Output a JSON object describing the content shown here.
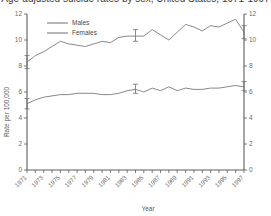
{
  "chart_title": "Age-adjusted suicide rates by sex, United States, 1971-1997",
  "axes": {
    "xlabel": "Year",
    "ylabel": "Rate per 100,000",
    "ylim": [
      0,
      12
    ],
    "yticks": [
      0,
      2,
      4,
      6,
      8,
      10,
      12
    ],
    "ytick_labels": [
      "0",
      "2",
      "4",
      "6",
      "8",
      "10",
      "12"
    ],
    "right_axis_labels": [
      "0",
      "2",
      "4",
      "6",
      "8",
      "10",
      "12"
    ],
    "xlim": [
      1971,
      1997
    ],
    "xtick_labels": [
      "1971",
      "1973",
      "1975",
      "1977",
      "1979",
      "1981",
      "1983",
      "1985",
      "1987",
      "1989",
      "1991",
      "1993",
      "1995",
      "1997"
    ],
    "xtick_rotation": -45,
    "grid": false
  },
  "legend": {
    "position": "top-left-inside",
    "entries": [
      {
        "label": "Males",
        "color": "#7b7b7b"
      },
      {
        "label": "Females",
        "color": "#7b7b7b"
      }
    ]
  },
  "colors": {
    "line": "#7b7b7b",
    "axis": "#5c5c5c",
    "tick_text": "#6b6b6b",
    "title_text": "#3a3a3a",
    "background": "#ffffff"
  },
  "chart_data": {
    "type": "line",
    "title": "Age-adjusted suicide rates by sex, United States, 1971-1997",
    "xlabel": "Year",
    "ylabel": "Rate per 100,000",
    "ylim": [
      0,
      12
    ],
    "xlim": [
      1971,
      1997
    ],
    "grid": false,
    "x": [
      1971,
      1972,
      1973,
      1974,
      1975,
      1976,
      1977,
      1978,
      1979,
      1980,
      1981,
      1982,
      1983,
      1984,
      1985,
      1986,
      1987,
      1988,
      1989,
      1990,
      1991,
      1992,
      1993,
      1994,
      1995,
      1996,
      1997
    ],
    "series": [
      {
        "name": "Males",
        "color": "#7b7b7b",
        "values": [
          8.3,
          8.8,
          9.1,
          9.5,
          9.9,
          9.7,
          9.6,
          9.5,
          9.7,
          9.9,
          9.8,
          10.2,
          10.3,
          10.3,
          10.3,
          10.8,
          10.4,
          10.0,
          10.6,
          11.2,
          11.0,
          10.7,
          11.1,
          11.0,
          11.3,
          11.6,
          10.6
        ],
        "error_bars": [
          {
            "x": 1971,
            "y": 8.3,
            "low": 7.8,
            "high": 8.8
          },
          {
            "x": 1984,
            "y": 10.3,
            "low": 9.9,
            "high": 10.8
          },
          {
            "x": 1997,
            "y": 10.6,
            "low": 10.1,
            "high": 11.1
          }
        ]
      },
      {
        "name": "Females",
        "color": "#7b7b7b",
        "values": [
          5.1,
          5.4,
          5.6,
          5.7,
          5.8,
          5.8,
          5.9,
          5.9,
          5.9,
          5.8,
          5.8,
          5.9,
          6.1,
          6.2,
          6.0,
          6.3,
          6.1,
          6.4,
          6.1,
          6.3,
          6.2,
          6.2,
          6.3,
          6.3,
          6.4,
          6.5,
          6.4
        ],
        "error_bars": [
          {
            "x": 1971,
            "y": 5.1,
            "low": 4.7,
            "high": 5.5
          },
          {
            "x": 1984,
            "y": 6.2,
            "low": 5.9,
            "high": 6.6
          },
          {
            "x": 1997,
            "y": 6.4,
            "low": 6.1,
            "high": 6.8
          }
        ]
      }
    ]
  }
}
